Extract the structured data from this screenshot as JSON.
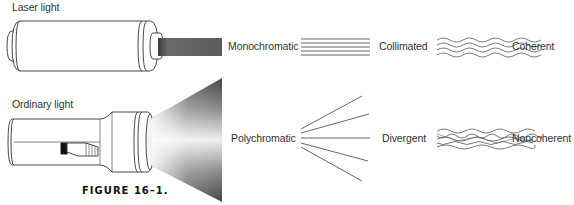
{
  "figure": {
    "caption": "FIGURE 16–1.",
    "rows": [
      {
        "source_label": "Laser light",
        "properties": [
          "Monochromatic",
          "Collimated",
          "Coherent"
        ]
      },
      {
        "source_label": "Ordinary light",
        "properties": [
          "Polychromatic",
          "Divergent",
          "Noncoherent"
        ]
      }
    ]
  },
  "colors": {
    "line": "#444444",
    "beam_dark": "#555555",
    "text": "#333333"
  }
}
